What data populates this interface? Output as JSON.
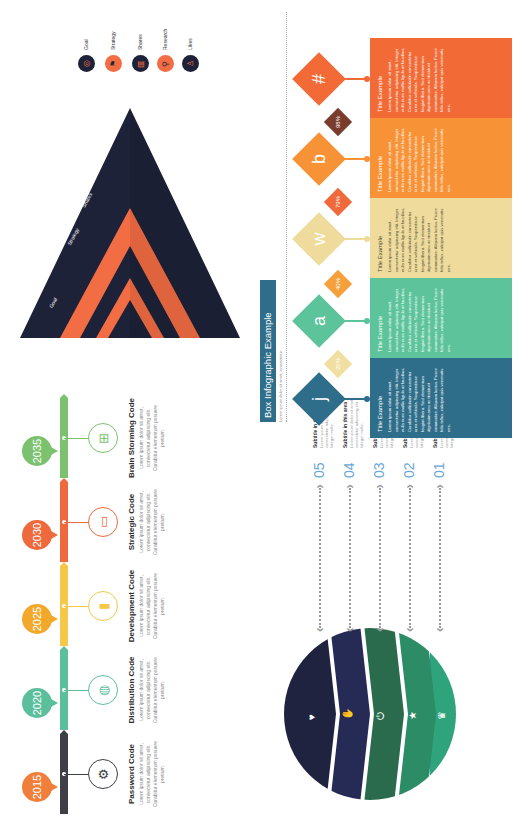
{
  "timeline": {
    "items": [
      {
        "year": "2015",
        "color": "#f07f3c",
        "ribbon_color": "#3d3f44",
        "icon": "gears-icon",
        "glyph": "⚙",
        "title": "Password Code",
        "desc": "Lorem ipsum dolor sit amet, consectetur adipiscing elit. Curabitur elementum posuere pretium."
      },
      {
        "year": "2020",
        "color": "#5cbf9c",
        "ribbon_color": "#5cbf9c",
        "icon": "globe-icon",
        "glyph": "◍",
        "title": "Distribution Code",
        "desc": "Lorem ipsum dolor sit amet, consectetur adipiscing elit. Curabitur elementum posuere pretium."
      },
      {
        "year": "2025",
        "color": "#f2a92b",
        "ribbon_color": "#f5c84a",
        "icon": "chart-icon",
        "glyph": "▮",
        "title": "Development Code",
        "desc": "Lorem ipsum dolor sit amet, consectetur adipiscing elit. Curabitur elementum posuere pretium."
      },
      {
        "year": "2030",
        "color": "#ee6a3d",
        "ribbon_color": "#ee6a3d",
        "icon": "monitor-icon",
        "glyph": "▭",
        "title": "Strategic Code",
        "desc": "Lorem ipsum dolor sit amet, consectetur adipiscing elit. Curabitur elementum posuere pretium."
      },
      {
        "year": "2035",
        "color": "#7cc26e",
        "ribbon_color": "#7cc26e",
        "icon": "hierarchy-icon",
        "glyph": "⊞",
        "title": "Brain Storming Code",
        "desc": "Lorem ipsum dolor sit amet, consectetur adipiscing elit. Curabitur elementum posuere pretium."
      }
    ]
  },
  "pyramid": {
    "colors": {
      "dark": "#1d2238",
      "accent": "#f26d44"
    },
    "layers": [
      "Likes",
      "Research",
      "Shares",
      "Strategy",
      "Goal"
    ]
  },
  "legend": {
    "items": [
      {
        "label": "Likes",
        "icon": "like-icon",
        "glyph": "♙",
        "bg": "#1d2238",
        "fg": "#f26d44"
      },
      {
        "label": "Research",
        "icon": "search-icon",
        "glyph": "⚲",
        "bg": "#f26d44",
        "fg": "#1d2238"
      },
      {
        "label": "Shares",
        "icon": "share-icon",
        "glyph": "▥",
        "bg": "#1d2238",
        "fg": "#f26d44"
      },
      {
        "label": "Strategy",
        "icon": "strategy-icon",
        "glyph": "⚑",
        "bg": "#f26d44",
        "fg": "#1d2238"
      },
      {
        "label": "Goal",
        "icon": "target-icon",
        "glyph": "◎",
        "bg": "#1d2238",
        "fg": "#f26d44"
      }
    ]
  },
  "steps": {
    "colors": [
      "#2fa37c",
      "#2b8c66",
      "#2a6b4d",
      "#262b55",
      "#1f2340"
    ],
    "icons": [
      {
        "name": "trophy-icon",
        "glyph": "♛"
      },
      {
        "name": "star-icon",
        "glyph": "★"
      },
      {
        "name": "power-icon",
        "glyph": "⏻"
      },
      {
        "name": "thumbs-up-icon",
        "glyph": "✋"
      },
      {
        "name": "heart-icon",
        "glyph": "♥"
      }
    ],
    "items": [
      {
        "num": "01",
        "subtitle": "Subtitle in this area",
        "text": "Lorem ipsum dolor sit amet, consectetur adipiscing elit. Integer mollis."
      },
      {
        "num": "02",
        "subtitle": "Subtitle in this area",
        "text": "Lorem ipsum dolor sit amet, consectetur adipiscing elit. Integer mollis."
      },
      {
        "num": "03",
        "subtitle": "Subtitle in this area",
        "text": "Lorem ipsum dolor sit amet, consectetur adipiscing elit. Integer mollis."
      },
      {
        "num": "04",
        "subtitle": "Subtitle in this area",
        "text": "Lorem ipsum dolor sit amet, consectetur adipiscing elit. Integer mollis."
      },
      {
        "num": "05",
        "subtitle": "Subtitle in this area",
        "text": "Lorem ipsum dolor sit amet, consectetur adipiscing elit. Integer mollis."
      }
    ]
  },
  "box_infographic": {
    "title": "Box Infographic Example",
    "subtitle": "Lorem ipsum dolor sit amet, consectetur",
    "items": [
      {
        "letter": "j",
        "percent": "20%",
        "color": "#2f6e8a",
        "pct_color": "#f0dfa0",
        "box_title": "Title Example",
        "text": "Lorem ipsum dolor sit amet, consectetur adipiscing elit. Integer nulla nunc mollis ligula at faucibus. Curabitur sollicitudin consectetur urna et vehicula. Suspendisse feugiat libero. Sed elementum dignissim arcu ac tincidunt commodae. Aliquam luctus. Fusce felis tellus, volutpat quis venenatis nec."
      },
      {
        "letter": "a",
        "percent": "40%",
        "color": "#5cc39a",
        "pct_color": "#f5a03a",
        "box_title": "Title Example",
        "text": "Lorem ipsum dolor sit amet, consectetur adipiscing elit. Integer nulla nunc mollis ligula at faucibus. Curabitur sollicitudin consectetur urna et vehicula. Suspendisse feugiat libero. Sed elementum dignissim arcu ac tincidunt commodae. Aliquam luctus. Fusce felis tellus, volutpat quis venenatis nec."
      },
      {
        "letter": "w",
        "percent": "79%",
        "color": "#efdc9c",
        "pct_color": "#f0693a",
        "box_title": "Title Example",
        "text": "Lorem ipsum dolor sit amet, consectetur adipiscing elit. Integer nulla nunc mollis ligula at faucibus. Curabitur sollicitudin consectetur urna et vehicula. Suspendisse feugiat libero. Sed elementum dignissim arcu ac tincidunt commodae. Aliquam luctus. Fusce felis tellus, volutpat quis venenatis nec."
      },
      {
        "letter": "b",
        "percent": "98%",
        "color": "#f89236",
        "pct_color": "#7a3c2c",
        "box_title": "Title Example",
        "text": "Lorem ipsum dolor sit amet, consectetur adipiscing elit. Integer nulla nunc mollis ligula at faucibus. Curabitur sollicitudin consectetur urna et vehicula. Suspendisse feugiat libero. Sed elementum dignissim arcu ac tincidunt commodae. Aliquam luctus. Fusce felis tellus, volutpat quis venenatis nec."
      },
      {
        "letter": "#",
        "percent": "",
        "color": "#f26a35",
        "pct_color": "",
        "box_title": "Title Example",
        "text": "Lorem ipsum dolor sit amet, consectetur adipiscing elit. Integer nulla nunc mollis ligula at faucibus. Curabitur sollicitudin consectetur urna et vehicula. Suspendisse feugiat libero. Sed elementum dignissim arcu ac tincidunt commodae. Aliquam luctus. Fusce felis tellus, volutpat quis venenatis nec."
      }
    ]
  }
}
